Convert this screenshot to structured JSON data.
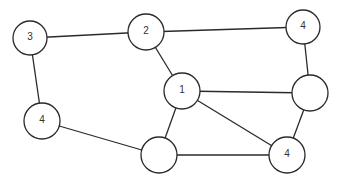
{
  "graph": {
    "nodes": [
      {
        "id": "n3",
        "label": "3",
        "x": 30,
        "y": 38,
        "r": 17
      },
      {
        "id": "n2",
        "label": "2",
        "x": 146,
        "y": 32,
        "r": 18
      },
      {
        "id": "n4top",
        "label": "4",
        "x": 303,
        "y": 27,
        "r": 17
      },
      {
        "id": "n4left",
        "label": "4",
        "x": 42,
        "y": 121,
        "r": 18
      },
      {
        "id": "n1",
        "label": "1",
        "x": 182,
        "y": 91,
        "r": 18
      },
      {
        "id": "nright",
        "label": "",
        "x": 310,
        "y": 93,
        "r": 18
      },
      {
        "id": "nbottom",
        "label": "",
        "x": 159,
        "y": 155,
        "r": 18
      },
      {
        "id": "n4bottom",
        "label": "4",
        "x": 287,
        "y": 155,
        "r": 18
      }
    ],
    "edges": [
      [
        "n3",
        "n2"
      ],
      [
        "n2",
        "n4top"
      ],
      [
        "n3",
        "n4left"
      ],
      [
        "n2",
        "n1"
      ],
      [
        "n4top",
        "nright"
      ],
      [
        "n1",
        "nright"
      ],
      [
        "n1",
        "n4bottom"
      ],
      [
        "n1",
        "nbottom"
      ],
      [
        "n4left",
        "nbottom"
      ],
      [
        "nbottom",
        "n4bottom"
      ],
      [
        "nright",
        "n4bottom"
      ]
    ]
  }
}
